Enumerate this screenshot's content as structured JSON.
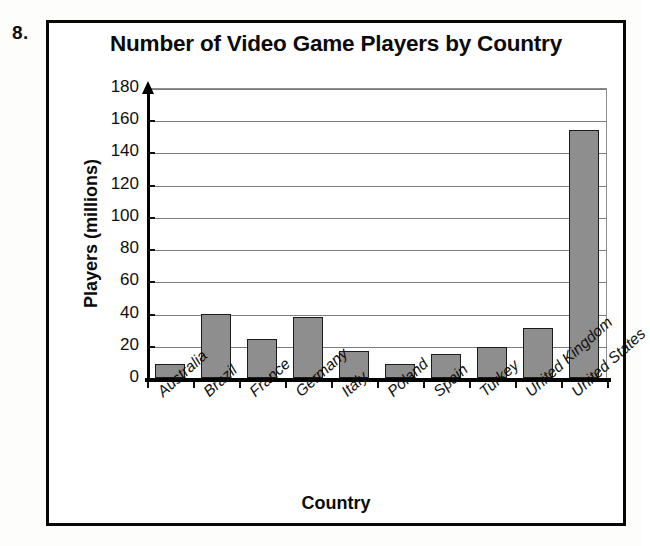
{
  "worksheet": {
    "problem_number": "8."
  },
  "chart_data": {
    "type": "bar",
    "title": "Number of Video Game Players by Country",
    "xlabel": "Country",
    "ylabel": "Players (millions)",
    "categories": [
      "Australia",
      "Brazil",
      "France",
      "Germany",
      "Italy",
      "Poland",
      "Spain",
      "Turkey",
      "United Kingdom",
      "United States"
    ],
    "values": [
      9,
      40,
      24,
      38,
      17,
      9,
      15,
      19,
      31,
      154
    ],
    "ylim": [
      0,
      180
    ],
    "ytick_step": 20,
    "yticks": [
      0,
      20,
      40,
      60,
      80,
      100,
      120,
      140,
      160,
      180
    ],
    "ytick_labels": [
      "0",
      "20",
      "40",
      "60",
      "80",
      "100",
      "120",
      "140",
      "160",
      "180"
    ],
    "grid": true,
    "legend": false,
    "bar_color": "#8e8e8e",
    "bar_edge_color": "#1b1b1b",
    "axis_color": "#000000",
    "gridline_color": "#7c7c7c"
  }
}
